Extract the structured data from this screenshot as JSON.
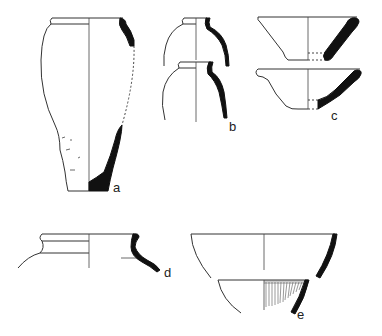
{
  "figure": {
    "type": "archaeological pottery profile drawings",
    "background": "#ffffff",
    "ink_color": "#111111",
    "vessels": [
      {
        "id": "a",
        "label": "a",
        "description": "tall ovoid jar, profile and section"
      },
      {
        "id": "b",
        "label": "b",
        "description": "two small necked jars, profile and section"
      },
      {
        "id": "c",
        "label": "c",
        "description": "two conical bowls, profile and section"
      },
      {
        "id": "d",
        "label": "d",
        "description": "jar rim with everted lip"
      },
      {
        "id": "e",
        "label": "e",
        "description": "hemispherical bowl with hatched decoration fragment"
      }
    ]
  }
}
